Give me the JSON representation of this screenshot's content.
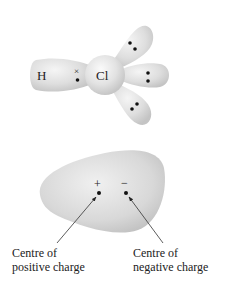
{
  "molecule": {
    "atom_left": "H",
    "atom_right": "Cl",
    "shared_electron_h_symbol": "×",
    "lone_pairs": 3
  },
  "dipole": {
    "positive_symbol": "+",
    "negative_symbol": "−",
    "positive_label_line1": "Centre of",
    "positive_label_line2": "positive charge",
    "negative_label_line1": "Centre of",
    "negative_label_line2": "negative charge"
  },
  "colors": {
    "lobe_fill": "#d9d9d9",
    "lobe_highlight": "#f2f2f2",
    "dot": "#111111",
    "text": "#222222"
  }
}
